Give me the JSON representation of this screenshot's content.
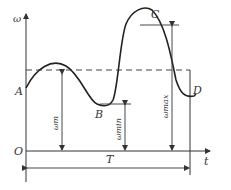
{
  "diagram": {
    "labels": {
      "y_axis": "ω",
      "x_axis": "t",
      "origin": "O",
      "point_a": "A",
      "point_b": "B",
      "point_c": "C",
      "point_d": "D",
      "omega_m": "ωm",
      "omega_min": "ωmin",
      "omega_max": "ωmax",
      "period": "T"
    },
    "colors": {
      "curve": "#222222",
      "lines": "#333333",
      "dashed_mean": "#444444"
    }
  }
}
